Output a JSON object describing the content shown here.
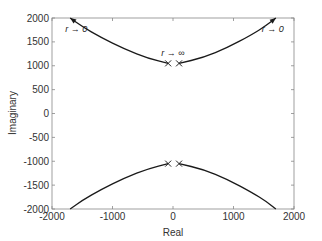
{
  "chart_data": {
    "type": "line",
    "title": "",
    "xlabel": "Real",
    "ylabel": "Imaginary",
    "xlim": [
      -2000,
      2000
    ],
    "ylim": [
      -2000,
      2000
    ],
    "xticks": [
      -2000,
      -1000,
      0,
      1000,
      2000
    ],
    "yticks": [
      2000,
      1500,
      1000,
      500,
      0,
      -500,
      -1000,
      -1500,
      -2000
    ],
    "xtick_labels": [
      "-2000",
      "-1000",
      "0",
      "1000",
      "2000"
    ],
    "ytick_labels": [
      "2000",
      "1500",
      "1000",
      "500",
      "0",
      "-500",
      "-1000",
      "-1500",
      "-2000"
    ],
    "grid": false,
    "legend": null,
    "line_color": "#1a1a1a",
    "markers": {
      "symbol": "x",
      "points": [
        {
          "x": -80,
          "y": 1050
        },
        {
          "x": 100,
          "y": 1050
        },
        {
          "x": -80,
          "y": -1050
        },
        {
          "x": 100,
          "y": -1050
        }
      ]
    },
    "series": [
      {
        "name": "upper-left branch",
        "x": [
          -80,
          -400,
          -800,
          -1200,
          -1500,
          -1700
        ],
        "y": [
          1050,
          1150,
          1350,
          1600,
          1820,
          2000
        ],
        "arrow_at": "end"
      },
      {
        "name": "upper-right branch",
        "x": [
          100,
          500,
          900,
          1300,
          1550,
          1700
        ],
        "y": [
          1050,
          1170,
          1380,
          1650,
          1850,
          2000
        ],
        "arrow_at": "end"
      },
      {
        "name": "lower-left branch",
        "x": [
          -80,
          -400,
          -800,
          -1200,
          -1500,
          -1700
        ],
        "y": [
          -1050,
          -1150,
          -1350,
          -1600,
          -1820,
          -2000
        ]
      },
      {
        "name": "lower-right branch",
        "x": [
          100,
          500,
          900,
          1300,
          1550,
          1700
        ],
        "y": [
          -1050,
          -1170,
          -1380,
          -1650,
          -1850,
          -2000
        ]
      }
    ],
    "annotations": [
      {
        "text": "r → 0",
        "x": -1600,
        "y": 1700
      },
      {
        "text": "r → 0",
        "x": 1650,
        "y": 1700
      },
      {
        "text": "r → ∞",
        "x": 0,
        "y": 1200
      }
    ]
  }
}
